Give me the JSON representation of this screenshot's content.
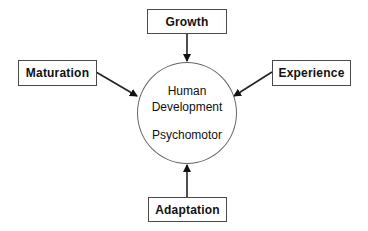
{
  "diagram": {
    "center": {
      "line1": "Human",
      "line2": "Development",
      "line3": "Psychomotor"
    },
    "nodes": {
      "top": "Growth",
      "left": "Maturation",
      "right": "Experience",
      "bottom": "Adaptation"
    },
    "edges": [
      {
        "from": "Growth",
        "to": "Human Development Psychomotor"
      },
      {
        "from": "Maturation",
        "to": "Human Development Psychomotor"
      },
      {
        "from": "Experience",
        "to": "Human Development Psychomotor"
      },
      {
        "from": "Adaptation",
        "to": "Human Development Psychomotor"
      }
    ],
    "colors": {
      "stroke": "#222222",
      "box_border": "#4a4a4a",
      "circle_border": "#666666",
      "background": "#ffffff"
    }
  }
}
